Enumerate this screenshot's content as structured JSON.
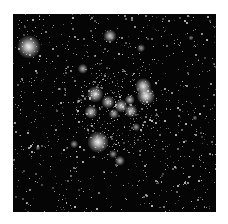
{
  "image": {
    "subject": "Star cluster field (astronomical image)",
    "background_color": "#050505",
    "margin_color": "#ffffff",
    "field_box": {
      "x": 13,
      "y": 14,
      "w": 203,
      "h": 198
    }
  },
  "bright_stars": [
    {
      "x": 16,
      "y": 33,
      "r": 9,
      "intensity": 0.95
    },
    {
      "x": 97,
      "y": 22,
      "r": 5,
      "intensity": 0.8
    },
    {
      "x": 128,
      "y": 34,
      "r": 3,
      "intensity": 0.6
    },
    {
      "x": 70,
      "y": 55,
      "r": 4,
      "intensity": 0.7
    },
    {
      "x": 130,
      "y": 72,
      "r": 6,
      "intensity": 0.9
    },
    {
      "x": 133,
      "y": 82,
      "r": 7,
      "intensity": 0.95
    },
    {
      "x": 82,
      "y": 80,
      "r": 6,
      "intensity": 0.85
    },
    {
      "x": 95,
      "y": 88,
      "r": 5,
      "intensity": 0.8
    },
    {
      "x": 108,
      "y": 92,
      "r": 5,
      "intensity": 0.8
    },
    {
      "x": 117,
      "y": 86,
      "r": 4,
      "intensity": 0.75
    },
    {
      "x": 118,
      "y": 97,
      "r": 5,
      "intensity": 0.8
    },
    {
      "x": 78,
      "y": 98,
      "r": 5,
      "intensity": 0.8
    },
    {
      "x": 101,
      "y": 100,
      "r": 4,
      "intensity": 0.7
    },
    {
      "x": 123,
      "y": 113,
      "r": 3,
      "intensity": 0.6
    },
    {
      "x": 85,
      "y": 128,
      "r": 8,
      "intensity": 0.95
    },
    {
      "x": 61,
      "y": 130,
      "r": 3,
      "intensity": 0.6
    },
    {
      "x": 107,
      "y": 147,
      "r": 4,
      "intensity": 0.7
    },
    {
      "x": 100,
      "y": 140,
      "r": 3,
      "intensity": 0.6
    },
    {
      "x": 182,
      "y": 104,
      "r": 2,
      "intensity": 0.5
    },
    {
      "x": 178,
      "y": 24,
      "r": 2,
      "intensity": 0.5
    },
    {
      "x": 25,
      "y": 134,
      "r": 2,
      "intensity": 0.5
    }
  ],
  "faint_star_field": {
    "count": 900,
    "seed": 7,
    "cluster_center": {
      "x": 104,
      "y": 96
    },
    "cluster_count": 260,
    "cluster_spread": 26
  }
}
